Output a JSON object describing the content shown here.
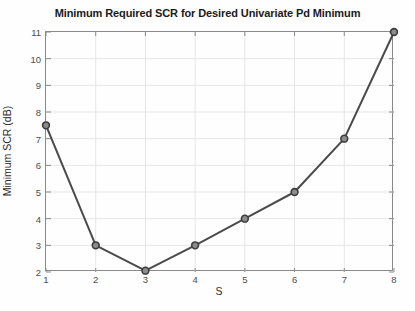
{
  "chart_data": {
    "type": "line",
    "title": "Minimum Required SCR for Desired Univariate Pd Minimum",
    "xlabel": "S",
    "ylabel": "Minimum SCR (dB)",
    "x": [
      1,
      2,
      3,
      4,
      5,
      6,
      7,
      8
    ],
    "values": [
      7.5,
      3.0,
      2.05,
      3.0,
      4.0,
      5.0,
      7.0,
      11.0
    ],
    "xlim": [
      1,
      8
    ],
    "ylim": [
      2,
      11
    ],
    "xticks": [
      1,
      2,
      3,
      4,
      5,
      6,
      7,
      8
    ],
    "yticks": [
      2,
      3,
      4,
      5,
      6,
      7,
      8,
      9,
      10,
      11
    ],
    "xtick_labels": [
      "1",
      "2",
      "3",
      "4",
      "5",
      "6",
      "7",
      "8"
    ],
    "ytick_labels": [
      "2",
      "3",
      "4",
      "5",
      "6",
      "7",
      "8",
      "9",
      "10",
      "11"
    ],
    "grid": true,
    "legend": null,
    "marker": "circle",
    "line_color": "#4a4a4a",
    "marker_edge_color": "#3c3c3c",
    "marker_face_color": "#8c8c8c",
    "grid_color": "#e6e6e6",
    "axis_color": "#8a8a8a"
  }
}
